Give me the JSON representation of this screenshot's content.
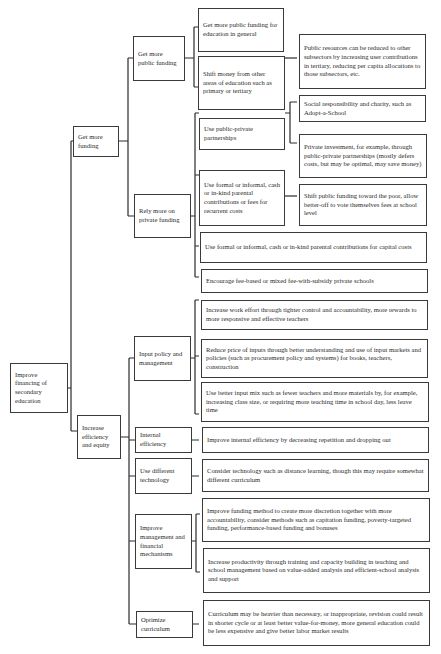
{
  "diagram": {
    "type": "tree",
    "root": {
      "id": "root",
      "label": "Improve financing of secondary education"
    },
    "level1": [
      {
        "id": "l1a",
        "label": "Get more funding"
      },
      {
        "id": "l1b",
        "label": "Increase efficiency and equity"
      }
    ],
    "level2": [
      {
        "id": "l2a",
        "parent": "l1a",
        "label": "Get more public funding"
      },
      {
        "id": "l2b",
        "parent": "l1a",
        "label": "Rely more on private funding"
      },
      {
        "id": "l2c",
        "parent": "l1b",
        "label": "Input policy and management"
      },
      {
        "id": "l2d",
        "parent": "l1b",
        "label": "Internal efficiency"
      },
      {
        "id": "l2e",
        "parent": "l1b",
        "label": "Use different technology"
      },
      {
        "id": "l2f",
        "parent": "l1b",
        "label": "Improve management and financial mechanisms"
      },
      {
        "id": "l2g",
        "parent": "l1b",
        "label": "Optimize curriculum"
      }
    ],
    "level3": [
      {
        "id": "l3a",
        "parent": "l2a",
        "label": "Get more public funding for education in general"
      },
      {
        "id": "l3b",
        "parent": "l2a",
        "label": "Shift money from other areas of education such as primary or tertiary"
      },
      {
        "id": "l3c",
        "parent": "l2b",
        "label": "Use public-private partnerships"
      },
      {
        "id": "l3d",
        "parent": "l2b",
        "label": "Use formal or informal, cash or in-kind parental contributions or fees for recurrent costs"
      },
      {
        "id": "l3e",
        "parent": "l2b",
        "label": "Use formal or informal, cash or in-kind parental contributions for capital costs"
      },
      {
        "id": "l3f",
        "parent": "l2b",
        "label": "Encourage fee-based or mixed fee-with-subsidy private schools"
      },
      {
        "id": "l3g",
        "parent": "l2c",
        "label": "Increase work effort through tighter control and accountability, more rewards to more responsive and effective teachers"
      },
      {
        "id": "l3h",
        "parent": "l2c",
        "label": "Reduce price of inputs through better understanding and use of input markets and policies (such as procurement policy and systems) for books, teachers, construction"
      },
      {
        "id": "l3i",
        "parent": "l2c",
        "label": "Use better input mix such as fewer teachers and more materials by, for example, increasing class size, or requiring more teaching time in school day, less leave time"
      },
      {
        "id": "l3j",
        "parent": "l2d",
        "label": "Improve internal efficiency by decreasing repetition and dropping out"
      },
      {
        "id": "l3k",
        "parent": "l2e",
        "label": "Consider technology such as distance learning, though this may require somewhat different curriculum"
      },
      {
        "id": "l3l",
        "parent": "l2f",
        "label": "Improve funding method to create more discretion together with more accountability, consider methods such as capitation funding, poverty-targeted funding, performance-based funding and bonuses"
      },
      {
        "id": "l3m",
        "parent": "l2f",
        "label": "Increase productivity through training and capacity building in teaching and school management based on value-added analysis and efficient-school analysis and support"
      },
      {
        "id": "l3n",
        "parent": "l2g",
        "label": "Curriculum may be heavier than necessary, or inappropriate, revision could result in shorter cycle or at least better value-for-money, more general education could be less expensive and give better labor market results"
      }
    ],
    "level4": [
      {
        "id": "l4a",
        "parent": "l3b",
        "label": "Public resources can be reduced to other subsectors by increasing user contributions in tertiary, reducing per capita allocations to those subsectors, etc."
      },
      {
        "id": "l4b",
        "parent": "l3c",
        "label": "Social responsibility and charity, such as Adopt-a-School"
      },
      {
        "id": "l4c",
        "parent": "l3c",
        "label": "Private investment, for example, through public-private partnerships (mostly defers costs, but may be optimal, may save money)"
      },
      {
        "id": "l4d",
        "parent": "l3d",
        "label": "Shift public funding toward the poor, allow better-off to vote themselves fees at school level"
      }
    ]
  }
}
